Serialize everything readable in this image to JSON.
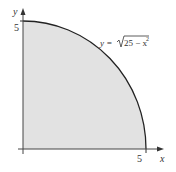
{
  "figure": {
    "x_axis_label": "x",
    "y_axis_label": "y",
    "x_tick": "5",
    "y_tick": "5",
    "curve_label_lhs": "y = ",
    "curve_label_radicand": "25 − x",
    "curve_label_exp": "2",
    "fill_color": "#e2e2e2",
    "curve_color": "#222222"
  }
}
